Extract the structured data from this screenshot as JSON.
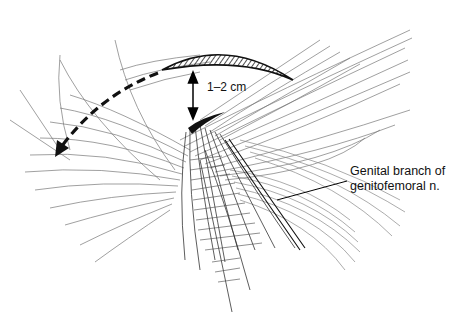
{
  "figure": {
    "labels": {
      "measurement": "1–2 cm",
      "nerve_line1": "Genital branch of",
      "nerve_line2": "genitofemoral n."
    },
    "colors": {
      "ink": "#111111",
      "hatch": "#555555",
      "background": "#ffffff"
    },
    "annotations": [
      {
        "type": "incision",
        "shape": "crescent, hatched"
      },
      {
        "type": "double-arrow",
        "meaning": "distance 1–2 cm between incision and cord"
      },
      {
        "type": "dashed-arrow",
        "direction": "curving down-left"
      },
      {
        "type": "leader-line",
        "target": "genital branch of genitofemoral nerve"
      }
    ]
  }
}
